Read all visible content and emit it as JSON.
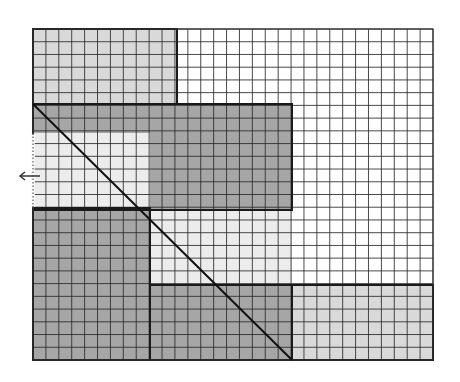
{
  "diagram": {
    "grid": {
      "x": 33,
      "y": 29,
      "width": 400,
      "height": 331,
      "cols": 31,
      "rows": 26,
      "line_color": "#2a2a2a",
      "background": "#ffffff"
    },
    "colors": {
      "light": "#d9d9d9",
      "dark": "#a6a6a6",
      "white": "#ffffff",
      "diagonal": "#111111",
      "arrow": "#333333"
    },
    "regions": [
      {
        "name": "top-left-light",
        "shade": "light",
        "x": 33,
        "y": 29,
        "w": 144,
        "h": 75
      },
      {
        "name": "upper-dark-band",
        "shade": "dark",
        "x": 33,
        "y": 104,
        "w": 259,
        "h": 29
      },
      {
        "name": "upper-right-dark-block",
        "shade": "dark",
        "x": 150,
        "y": 133,
        "w": 142,
        "h": 77
      },
      {
        "name": "left-light-notch",
        "shade": "light-pale",
        "x": 33,
        "y": 133,
        "w": 117,
        "h": 75
      },
      {
        "name": "middle-light",
        "shade": "light-pale",
        "x": 150,
        "y": 210,
        "w": 142,
        "h": 75
      },
      {
        "name": "bottom-left-dark",
        "shade": "dark",
        "x": 33,
        "y": 208,
        "w": 117,
        "h": 152
      },
      {
        "name": "bottom-middle-dark",
        "shade": "dark",
        "x": 150,
        "y": 285,
        "w": 142,
        "h": 75
      },
      {
        "name": "bottom-right-light",
        "shade": "light",
        "x": 292,
        "y": 285,
        "w": 141,
        "h": 75
      }
    ],
    "outlines": [
      {
        "x": 33,
        "y": 29,
        "w": 144,
        "h": 75
      },
      {
        "x": 33,
        "y": 104,
        "w": 259,
        "h": 106
      },
      {
        "x": 33,
        "y": 208,
        "w": 117,
        "h": 152
      },
      {
        "x": 150,
        "y": 285,
        "w": 142,
        "h": 75
      },
      {
        "x": 292,
        "y": 285,
        "w": 141,
        "h": 75
      }
    ],
    "dotted_edge": {
      "x": 33,
      "y1": 133,
      "y2": 208
    },
    "diagonal": {
      "x1": 33,
      "y1": 104,
      "x2": 292,
      "y2": 360
    },
    "arrow": {
      "x1": 40,
      "y1": 176,
      "x2": 20,
      "y2": 176,
      "direction": "left"
    }
  }
}
